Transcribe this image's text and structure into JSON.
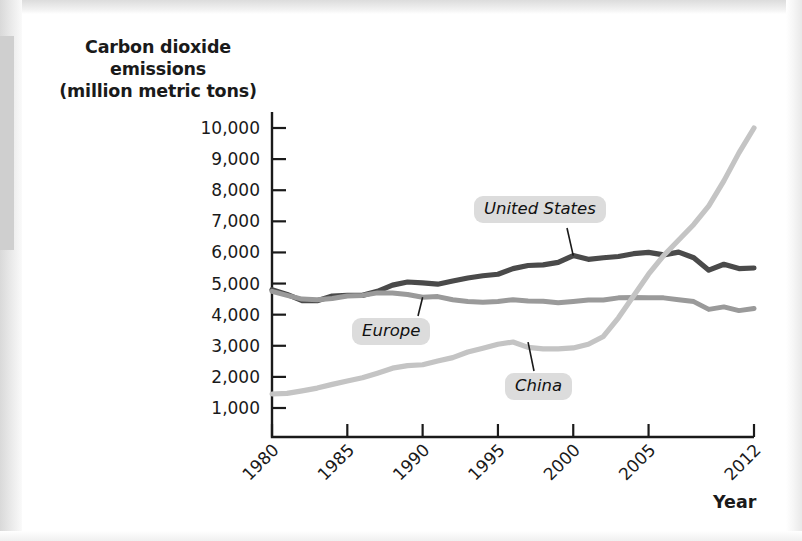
{
  "figure": {
    "y_axis_title_lines": [
      "Carbon dioxide",
      "emissions",
      "(million metric tons)"
    ],
    "x_axis_title": "Year"
  },
  "chart_data": {
    "type": "line",
    "title": "",
    "xlabel": "Year",
    "ylabel": "Carbon dioxide emissions (million metric tons)",
    "xlim": [
      1980,
      2012
    ],
    "ylim": [
      0,
      10500
    ],
    "grid": false,
    "legend": "inline-callout-labels",
    "x_tick_labels": [
      "1980",
      "1985",
      "1990",
      "1995",
      "2000",
      "2005",
      "2012"
    ],
    "x_tick_values": [
      1980,
      1985,
      1990,
      1995,
      2000,
      2005,
      2012
    ],
    "y_tick_labels": [
      "1,000",
      "2,000",
      "3,000",
      "4,000",
      "5,000",
      "6,000",
      "7,000",
      "8,000",
      "9,000",
      "10,000"
    ],
    "y_tick_values": [
      1000,
      2000,
      3000,
      4000,
      5000,
      6000,
      7000,
      8000,
      9000,
      10000
    ],
    "x": [
      1980,
      1981,
      1982,
      1983,
      1984,
      1985,
      1986,
      1987,
      1988,
      1989,
      1990,
      1991,
      1992,
      1993,
      1994,
      1995,
      1996,
      1997,
      1998,
      1999,
      2000,
      2001,
      2002,
      2003,
      2004,
      2005,
      2006,
      2007,
      2008,
      2009,
      2010,
      2011,
      2012
    ],
    "series": [
      {
        "name": "United States",
        "color": "#4a4a4a",
        "values": [
          4800,
          4650,
          4450,
          4450,
          4600,
          4620,
          4620,
          4750,
          4950,
          5050,
          5020,
          4980,
          5080,
          5180,
          5250,
          5300,
          5480,
          5580,
          5600,
          5680,
          5900,
          5780,
          5830,
          5870,
          5960,
          6000,
          5920,
          6010,
          5830,
          5430,
          5620,
          5480,
          5500
        ]
      },
      {
        "name": "Europe",
        "color": "#9a9a9a",
        "values": [
          4750,
          4620,
          4500,
          4480,
          4520,
          4600,
          4620,
          4700,
          4700,
          4650,
          4560,
          4580,
          4480,
          4420,
          4400,
          4420,
          4480,
          4440,
          4430,
          4380,
          4420,
          4470,
          4470,
          4540,
          4550,
          4540,
          4540,
          4480,
          4420,
          4170,
          4250,
          4130,
          4200
        ]
      },
      {
        "name": "China",
        "color": "#c4c4c4",
        "values": [
          1450,
          1470,
          1550,
          1640,
          1760,
          1870,
          1970,
          2120,
          2280,
          2360,
          2390,
          2510,
          2620,
          2800,
          2920,
          3050,
          3120,
          2950,
          2900,
          2900,
          2930,
          3050,
          3300,
          3900,
          4600,
          5300,
          5900,
          6400,
          6900,
          7500,
          8300,
          9200,
          10000
        ]
      }
    ],
    "callouts": [
      {
        "label": "United States",
        "series": "United States",
        "anchor_year": 2000,
        "anchor_value": 5900
      },
      {
        "label": "Europe",
        "series": "Europe",
        "anchor_year": 1990,
        "anchor_value": 4560
      },
      {
        "label": "China",
        "series": "China",
        "anchor_year": 1997,
        "anchor_value": 3120
      }
    ]
  }
}
